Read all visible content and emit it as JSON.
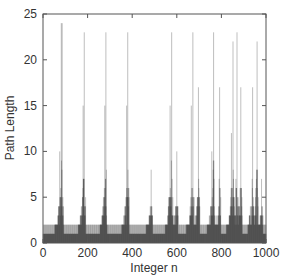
{
  "chart_data": {
    "type": "bar",
    "title": "",
    "xlabel": "Integer n",
    "ylabel": "Path Length",
    "xlim": [
      0,
      1000
    ],
    "ylim": [
      0,
      25
    ],
    "xticks": [
      0,
      200,
      400,
      600,
      800,
      1000
    ],
    "yticks": [
      0,
      5,
      10,
      15,
      20,
      25
    ],
    "grid": false,
    "legend": null,
    "peaks": [
      {
        "n": 82,
        "value": 24
      },
      {
        "n": 86,
        "value": 24
      },
      {
        "n": 185,
        "value": 23
      },
      {
        "n": 282,
        "value": 23
      },
      {
        "n": 380,
        "value": 23
      },
      {
        "n": 485,
        "value": 8
      },
      {
        "n": 577,
        "value": 23
      },
      {
        "n": 672,
        "value": 23
      },
      {
        "n": 765,
        "value": 23
      },
      {
        "n": 852,
        "value": 22
      },
      {
        "n": 870,
        "value": 23
      },
      {
        "n": 960,
        "value": 22
      }
    ],
    "secondary_peaks": [
      {
        "n": 75,
        "value": 10
      },
      {
        "n": 180,
        "value": 15
      },
      {
        "n": 277,
        "value": 15
      },
      {
        "n": 375,
        "value": 15
      },
      {
        "n": 570,
        "value": 15
      },
      {
        "n": 600,
        "value": 10
      },
      {
        "n": 665,
        "value": 15
      },
      {
        "n": 697,
        "value": 17
      },
      {
        "n": 757,
        "value": 10
      },
      {
        "n": 792,
        "value": 17
      },
      {
        "n": 845,
        "value": 12
      },
      {
        "n": 887,
        "value": 17
      },
      {
        "n": 940,
        "value": 17
      },
      {
        "n": 980,
        "value": 7
      }
    ],
    "baseline_values": [
      1,
      2
    ]
  },
  "axes": {
    "x_tick_labels": [
      "0",
      "200",
      "400",
      "600",
      "800",
      "1000"
    ],
    "y_tick_labels": [
      "0",
      "5",
      "10",
      "15",
      "20",
      "25"
    ]
  }
}
